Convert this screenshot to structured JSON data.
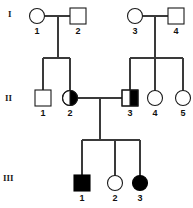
{
  "diagram": {
    "type": "pedigree-chart",
    "title": "",
    "colors": {
      "affected_fill": "#000000",
      "unaffected_fill": "#ffffff",
      "stroke": "#1a1a1a",
      "line": "#3a3a3a",
      "background": "#ffffff"
    },
    "generation_labels": [
      {
        "id": "gen-I",
        "text": "I",
        "x": 8,
        "y": 17
      },
      {
        "id": "gen-II",
        "text": "II",
        "x": 5,
        "y": 101
      },
      {
        "id": "gen-III",
        "text": "III",
        "x": 3,
        "y": 181
      }
    ],
    "individuals": [
      {
        "id": "I-1",
        "generation": "I",
        "number": "1",
        "sex": "female",
        "shape": "circle",
        "status": "unaffected",
        "fill": "open",
        "cx": 37,
        "cy": 16,
        "r": 7.5,
        "label_x": 37,
        "label_y": 34
      },
      {
        "id": "I-2",
        "generation": "I",
        "number": "2",
        "sex": "male",
        "shape": "square",
        "status": "unaffected",
        "fill": "open",
        "x": 70,
        "y": 8,
        "size": 16,
        "label_x": 78,
        "label_y": 34
      },
      {
        "id": "I-3",
        "generation": "I",
        "number": "3",
        "sex": "female",
        "shape": "circle",
        "status": "unaffected",
        "fill": "open",
        "cx": 135,
        "cy": 16,
        "r": 7.5,
        "label_x": 135,
        "label_y": 34
      },
      {
        "id": "I-4",
        "generation": "I",
        "number": "4",
        "sex": "male",
        "shape": "square",
        "status": "unaffected",
        "fill": "open",
        "x": 168,
        "y": 8,
        "size": 16,
        "label_x": 176,
        "label_y": 34
      },
      {
        "id": "II-1",
        "generation": "II",
        "number": "1",
        "sex": "male",
        "shape": "square",
        "status": "unaffected",
        "fill": "open",
        "x": 35,
        "y": 90,
        "size": 16,
        "label_x": 43,
        "label_y": 116
      },
      {
        "id": "II-2",
        "generation": "II",
        "number": "2",
        "sex": "female",
        "shape": "circle",
        "status": "carrier",
        "fill": "half-right",
        "cx": 70,
        "cy": 98,
        "r": 7.5,
        "label_x": 70,
        "label_y": 116
      },
      {
        "id": "II-3",
        "generation": "II",
        "number": "3",
        "sex": "male",
        "shape": "square",
        "status": "carrier",
        "fill": "half-right",
        "x": 122,
        "y": 90,
        "size": 16,
        "label_x": 130,
        "label_y": 116
      },
      {
        "id": "II-4",
        "generation": "II",
        "number": "4",
        "sex": "female",
        "shape": "circle",
        "status": "unaffected",
        "fill": "open",
        "cx": 155,
        "cy": 98,
        "r": 7.5,
        "label_x": 155,
        "label_y": 116
      },
      {
        "id": "II-5",
        "generation": "II",
        "number": "5",
        "sex": "female",
        "shape": "circle",
        "status": "unaffected",
        "fill": "open",
        "cx": 183,
        "cy": 98,
        "r": 7.5,
        "label_x": 183,
        "label_y": 116
      },
      {
        "id": "III-1",
        "generation": "III",
        "number": "1",
        "sex": "male",
        "shape": "square",
        "status": "affected",
        "fill": "filled",
        "x": 74,
        "y": 175,
        "size": 16,
        "label_x": 82,
        "label_y": 201
      },
      {
        "id": "III-2",
        "generation": "III",
        "number": "2",
        "sex": "female",
        "shape": "circle",
        "status": "unaffected",
        "fill": "open",
        "cx": 115,
        "cy": 183,
        "r": 7.5,
        "label_x": 115,
        "label_y": 201
      },
      {
        "id": "III-3",
        "generation": "III",
        "number": "3",
        "sex": "female",
        "shape": "circle",
        "status": "affected",
        "fill": "filled",
        "cx": 140,
        "cy": 183,
        "r": 7.5,
        "label_x": 140,
        "label_y": 201
      }
    ],
    "matings": [
      {
        "id": "mating-I-1-I-2",
        "partners": [
          "I-1",
          "I-2"
        ],
        "line": "M44.5 16 H70"
      },
      {
        "id": "mating-I-3-I-4",
        "partners": [
          "I-3",
          "I-4"
        ],
        "line": "M142.5 16 H168"
      },
      {
        "id": "mating-II-2-II-3",
        "partners": [
          "II-2",
          "II-3"
        ],
        "line": "M77.5 98 H122"
      }
    ],
    "sibships": [
      {
        "id": "sibship-gen-II-left",
        "parents": [
          "I-1",
          "I-2"
        ],
        "children": [
          "II-1",
          "II-2"
        ],
        "descent": "M58 16 V58",
        "bar": "M43 58 H70",
        "drops": [
          "M43 58 V90",
          "M70 58 V90.5"
        ]
      },
      {
        "id": "sibship-gen-II-right",
        "parents": [
          "I-3",
          "I-4"
        ],
        "children": [
          "II-3",
          "II-4",
          "II-5"
        ],
        "descent": "M155 16 V58",
        "bar": "M130 58 H183",
        "drops": [
          "M130 58 V90",
          "M155 58 V90.5",
          "M183 58 V90.5"
        ]
      },
      {
        "id": "sibship-gen-III",
        "parents": [
          "II-2",
          "II-3"
        ],
        "children": [
          "III-1",
          "III-2",
          "III-3"
        ],
        "descent": "M100 98 V140",
        "bar": "M82 140 H140",
        "drops": [
          "M82 140 V175",
          "M115 140 V175.5",
          "M140 140 V175.5"
        ]
      }
    ],
    "legend": {
      "square_meaning": "male",
      "circle_meaning": "female",
      "open_meaning": "unaffected",
      "half_filled_meaning": "carrier",
      "filled_meaning": "affected"
    }
  }
}
